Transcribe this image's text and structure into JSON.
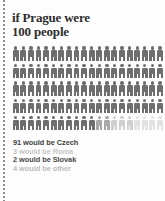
{
  "title": "if Prague were\n100 people",
  "pictogram": {
    "total": 100,
    "columns": 20,
    "rows": 5,
    "icon": "person-icon",
    "groups": [
      {
        "key": "czech",
        "label": "Czech",
        "count": 91,
        "color": "#6e6e6e"
      },
      {
        "key": "roma",
        "label": "Roma",
        "count": 3,
        "color": "#cfcfcf"
      },
      {
        "key": "slovak",
        "label": "Slovak",
        "count": 2,
        "color": "#a8a8a8"
      },
      {
        "key": "other",
        "label": "other",
        "count": 4,
        "color": "#e2e2e2"
      }
    ]
  },
  "legend": {
    "lines": [
      {
        "text": "91 would be Czech",
        "color": "#3d3d3d"
      },
      {
        "text": "3 would be Roma",
        "color": "#c6c6c6"
      },
      {
        "text": "2 would be Slovak",
        "color": "#4a4a4a"
      },
      {
        "text": "4 would be other",
        "color": "#bcbcbc"
      }
    ]
  },
  "chart_data": {
    "type": "pictogram",
    "title": "if Prague were 100 people",
    "unit": "1 icon = 1 person",
    "categories": [
      "Czech",
      "Roma",
      "Slovak",
      "other"
    ],
    "values": [
      91,
      3,
      2,
      4
    ],
    "colors": [
      "#6e6e6e",
      "#cfcfcf",
      "#a8a8a8",
      "#e2e2e2"
    ],
    "total": 100,
    "grid": {
      "rows": 5,
      "columns": 20
    },
    "legend_position": "below"
  }
}
